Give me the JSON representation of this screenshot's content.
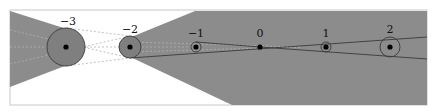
{
  "diagram": {
    "colors": {
      "shade": "#8c8c8c",
      "background": "#ffffff",
      "frame": "#c8c8c8",
      "point": "#000000",
      "line": "#3a3a3a",
      "dashed": "#b0b0b0"
    },
    "points": [
      {
        "label": "−3",
        "x": 66,
        "y": 47,
        "circle_r": 19
      },
      {
        "label": "−2",
        "x": 130,
        "y": 47,
        "circle_r": 11
      },
      {
        "label": "−1",
        "x": 196,
        "y": 47,
        "circle_r": 5
      },
      {
        "label": "0",
        "x": 260,
        "y": 47,
        "circle_r": 0
      },
      {
        "label": "1",
        "x": 326,
        "y": 47,
        "circle_r": 5
      },
      {
        "label": "2",
        "x": 390,
        "y": 47,
        "circle_r": 10
      }
    ]
  }
}
